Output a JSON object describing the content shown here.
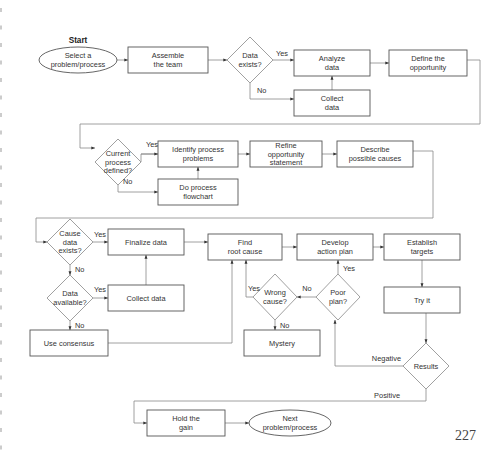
{
  "start_label": "Start",
  "page_number": "227",
  "colors": {
    "node_stroke": "#555555",
    "edge_stroke": "#888888",
    "text": "#333333",
    "background": "#ffffff"
  },
  "nodes": {
    "select_problem": {
      "type": "ellipse",
      "lines": [
        "Select a",
        "problem/process"
      ]
    },
    "assemble_team": {
      "type": "process",
      "lines": [
        "Assemble",
        "the team"
      ]
    },
    "data_exists": {
      "type": "decision",
      "lines": [
        "Data",
        "exists?"
      ]
    },
    "analyze_data": {
      "type": "process",
      "lines": [
        "Analyze",
        "data"
      ]
    },
    "collect_data_1": {
      "type": "process",
      "lines": [
        "Collect",
        "data"
      ]
    },
    "define_opportunity": {
      "type": "process",
      "lines": [
        "Define the",
        "opportunity"
      ]
    },
    "current_process_defined": {
      "type": "decision",
      "lines": [
        "Current",
        "process",
        "defined?"
      ]
    },
    "identify_problems": {
      "type": "process",
      "lines": [
        "Identify process",
        "problems"
      ]
    },
    "do_flowchart": {
      "type": "process",
      "lines": [
        "Do process",
        "flowchart"
      ]
    },
    "refine_statement": {
      "type": "process",
      "lines": [
        "Refine",
        "opportunity",
        "statement"
      ]
    },
    "describe_causes": {
      "type": "process",
      "lines": [
        "Describe",
        "possible causes"
      ]
    },
    "cause_data_exists": {
      "type": "decision",
      "lines": [
        "Cause",
        "data",
        "exists?"
      ]
    },
    "finalize_data": {
      "type": "process",
      "lines": [
        "Finalize data"
      ]
    },
    "data_available": {
      "type": "decision",
      "lines": [
        "Data",
        "available?"
      ]
    },
    "collect_data_2": {
      "type": "process",
      "lines": [
        "Collect data"
      ]
    },
    "use_consensus": {
      "type": "process",
      "lines": [
        "Use consensus"
      ]
    },
    "find_root_cause": {
      "type": "process",
      "lines": [
        "Find",
        "root cause"
      ]
    },
    "wrong_cause": {
      "type": "decision",
      "lines": [
        "Wrong",
        "cause?"
      ]
    },
    "mystery": {
      "type": "process",
      "lines": [
        "Mystery"
      ]
    },
    "develop_plan": {
      "type": "process",
      "lines": [
        "Develop",
        "action plan"
      ]
    },
    "poor_plan": {
      "type": "decision",
      "lines": [
        "Poor",
        "plan?"
      ]
    },
    "establish_targets": {
      "type": "process",
      "lines": [
        "Establish",
        "targets"
      ]
    },
    "try_it": {
      "type": "process",
      "lines": [
        "Try it"
      ]
    },
    "results": {
      "type": "decision",
      "lines": [
        "Results"
      ]
    },
    "hold_gain": {
      "type": "process",
      "lines": [
        "Hold the",
        "gain"
      ]
    },
    "next_problem": {
      "type": "ellipse",
      "lines": [
        "Next",
        "problem/process"
      ]
    }
  },
  "edge_labels": {
    "data_exists_yes": "Yes",
    "data_exists_no": "No",
    "current_yes": "Yes",
    "current_no": "No",
    "cause_data_yes": "Yes",
    "cause_data_no": "No",
    "data_available_yes": "Yes",
    "data_available_no": "No",
    "wrong_cause_yes": "Yes",
    "wrong_cause_no": "No",
    "poor_plan_yes": "Yes",
    "poor_plan_no": "No",
    "results_negative": "Negative",
    "results_positive": "Positive"
  }
}
